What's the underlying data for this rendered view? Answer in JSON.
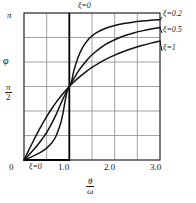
{
  "chart_data": {
    "type": "line",
    "title": "",
    "xlabel_num": "θ",
    "xlabel_den": "ω",
    "ylabel": "φ",
    "xlim": [
      0,
      3.0
    ],
    "ylim": [
      0,
      3.14159
    ],
    "grid": true,
    "legend_position": "right-outside",
    "x_ticks": [
      {
        "value": 0,
        "label": "0"
      },
      {
        "value": 1.0,
        "label": "1.0"
      },
      {
        "value": 2.0,
        "label": "2.0"
      },
      {
        "value": 3.0,
        "label": "3.0"
      }
    ],
    "x_gridlines": [
      0,
      0.5,
      1.0,
      1.5,
      2.0,
      2.5,
      3.0
    ],
    "y_ticks": [
      {
        "value": 0,
        "label": "0"
      },
      {
        "value": 1.5708,
        "label_num": "π",
        "label_den": "2"
      },
      {
        "value": 3.14159,
        "label": "π"
      }
    ],
    "y_gridlines": [
      0,
      0.5236,
      1.0472,
      1.5708,
      2.0944,
      2.618,
      3.14159
    ],
    "annotations": [
      {
        "name": "xi-zero-top",
        "text": "ξ=0",
        "x": 1.0,
        "y": 3.3
      },
      {
        "name": "xi-zero-axis",
        "text": "ξ=0",
        "x": 0.33,
        "y": -0.27
      }
    ],
    "asymptote": {
      "name": "xi-zero-step",
      "x": 1.0,
      "note": "ξ=0 undamped step from 0 to π at θ/ω = 1"
    },
    "series": [
      {
        "name": "ξ=0.2",
        "legend_label": "ξ=0.2",
        "color": "#111111",
        "points": [
          [
            0.0,
            0.0
          ],
          [
            0.1,
            0.04
          ],
          [
            0.2,
            0.082
          ],
          [
            0.3,
            0.129
          ],
          [
            0.4,
            0.185
          ],
          [
            0.5,
            0.255
          ],
          [
            0.6,
            0.351
          ],
          [
            0.7,
            0.498
          ],
          [
            0.8,
            0.757
          ],
          [
            0.85,
            0.955
          ],
          [
            0.9,
            1.218
          ],
          [
            0.95,
            1.467
          ],
          [
            1.0,
            1.571
          ],
          [
            1.05,
            1.68
          ],
          [
            1.1,
            1.91
          ],
          [
            1.2,
            2.211
          ],
          [
            1.3,
            2.418
          ],
          [
            1.4,
            2.556
          ],
          [
            1.5,
            2.652
          ],
          [
            1.6,
            2.722
          ],
          [
            1.8,
            2.816
          ],
          [
            2.0,
            2.876
          ],
          [
            2.2,
            2.917
          ],
          [
            2.4,
            2.946
          ],
          [
            2.6,
            2.968
          ],
          [
            2.8,
            2.985
          ],
          [
            3.0,
            2.998
          ]
        ]
      },
      {
        "name": "ξ=0.5",
        "legend_label": "ξ=0.5",
        "color": "#111111",
        "points": [
          [
            0.0,
            0.0
          ],
          [
            0.1,
            0.101
          ],
          [
            0.2,
            0.206
          ],
          [
            0.3,
            0.32
          ],
          [
            0.4,
            0.45
          ],
          [
            0.5,
            0.588
          ],
          [
            0.6,
            0.76
          ],
          [
            0.7,
            0.953
          ],
          [
            0.8,
            1.176
          ],
          [
            0.9,
            1.39
          ],
          [
            1.0,
            1.571
          ],
          [
            1.1,
            1.74
          ],
          [
            1.2,
            1.9
          ],
          [
            1.3,
            2.03
          ],
          [
            1.4,
            2.15
          ],
          [
            1.5,
            2.25
          ],
          [
            1.6,
            2.33
          ],
          [
            1.8,
            2.47
          ],
          [
            2.0,
            2.57
          ],
          [
            2.2,
            2.65
          ],
          [
            2.4,
            2.71
          ],
          [
            2.6,
            2.76
          ],
          [
            2.8,
            2.8
          ],
          [
            3.0,
            2.83
          ]
        ]
      },
      {
        "name": "ξ=1",
        "legend_label": "ξ=1",
        "color": "#111111",
        "points": [
          [
            0.0,
            0.0
          ],
          [
            0.1,
            0.199
          ],
          [
            0.2,
            0.395
          ],
          [
            0.3,
            0.583
          ],
          [
            0.4,
            0.761
          ],
          [
            0.5,
            0.927
          ],
          [
            0.6,
            1.08
          ],
          [
            0.7,
            1.22
          ],
          [
            0.8,
            1.348
          ],
          [
            0.9,
            1.464
          ],
          [
            1.0,
            1.571
          ],
          [
            1.1,
            1.668
          ],
          [
            1.2,
            1.756
          ],
          [
            1.3,
            1.837
          ],
          [
            1.4,
            1.911
          ],
          [
            1.5,
            1.978
          ],
          [
            1.6,
            2.04
          ],
          [
            1.8,
            2.149
          ],
          [
            2.0,
            2.241
          ],
          [
            2.2,
            2.32
          ],
          [
            2.4,
            2.388
          ],
          [
            2.6,
            2.446
          ],
          [
            2.8,
            2.498
          ],
          [
            3.0,
            2.544
          ]
        ]
      }
    ]
  }
}
